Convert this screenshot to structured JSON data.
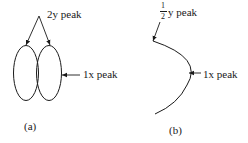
{
  "panel_a": {
    "top_label": "2y peak",
    "side_label": "1x peak",
    "caption": "(a)"
  },
  "panel_b": {
    "frac_numerator": "1",
    "frac_denominator": "2",
    "top_label": "y peak",
    "side_label": "1x peak",
    "caption": "(b)"
  },
  "colors": {
    "stroke": "#1a1a1a",
    "background": "#ffffff"
  }
}
